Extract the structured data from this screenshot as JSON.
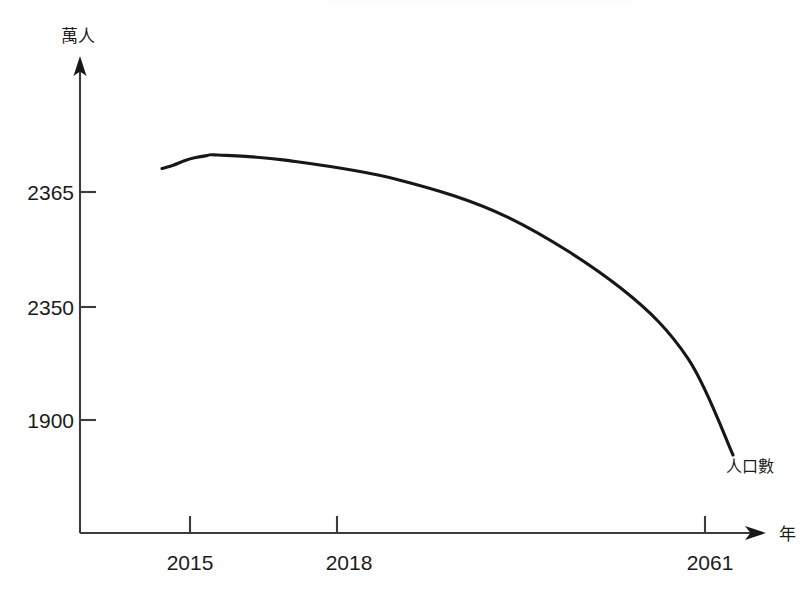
{
  "chart_data": {
    "type": "line",
    "title": "",
    "xlabel": "年",
    "ylabel": "萬人",
    "grid": false,
    "legend_position": "inline-end-of-curve",
    "series": [
      {
        "name": "人口數",
        "label": "人口數",
        "x": [
          2014,
          2015,
          2016,
          2017,
          2018,
          2019,
          2025,
          2035,
          2045,
          2055,
          2061,
          2065
        ],
        "values": [
          2347,
          2352,
          2359,
          2364,
          2367,
          2368,
          2360,
          2330,
          2270,
          2160,
          2050,
          1900
        ]
      }
    ],
    "x_ticks": [
      {
        "label": "2015",
        "value": 2015
      },
      {
        "label": "2018",
        "value": 2018
      },
      {
        "label": "2061",
        "value": 2061
      }
    ],
    "y_ticks": [
      {
        "label": "2365",
        "value": 2365
      },
      {
        "label": "2350",
        "value": 2350
      },
      {
        "label": "1900",
        "value": 1900
      }
    ],
    "annotations": [
      {
        "text": "人口數",
        "kind": "series-end-label"
      },
      {
        "text": "萬人",
        "kind": "y-axis-unit"
      },
      {
        "text": "年",
        "kind": "x-axis-unit"
      }
    ],
    "colors": {
      "curve": "#17171a",
      "axis": "#3a3a3f",
      "text": "#1b1b1b",
      "background": "#ffffff"
    }
  },
  "axes": {
    "y_unit_label": "萬人",
    "x_unit_label": "年"
  },
  "series_label": "人口數",
  "y_tick_labels": [
    "2365",
    "2350",
    "1900"
  ],
  "x_tick_labels": [
    "2015",
    "2018",
    "2061"
  ]
}
